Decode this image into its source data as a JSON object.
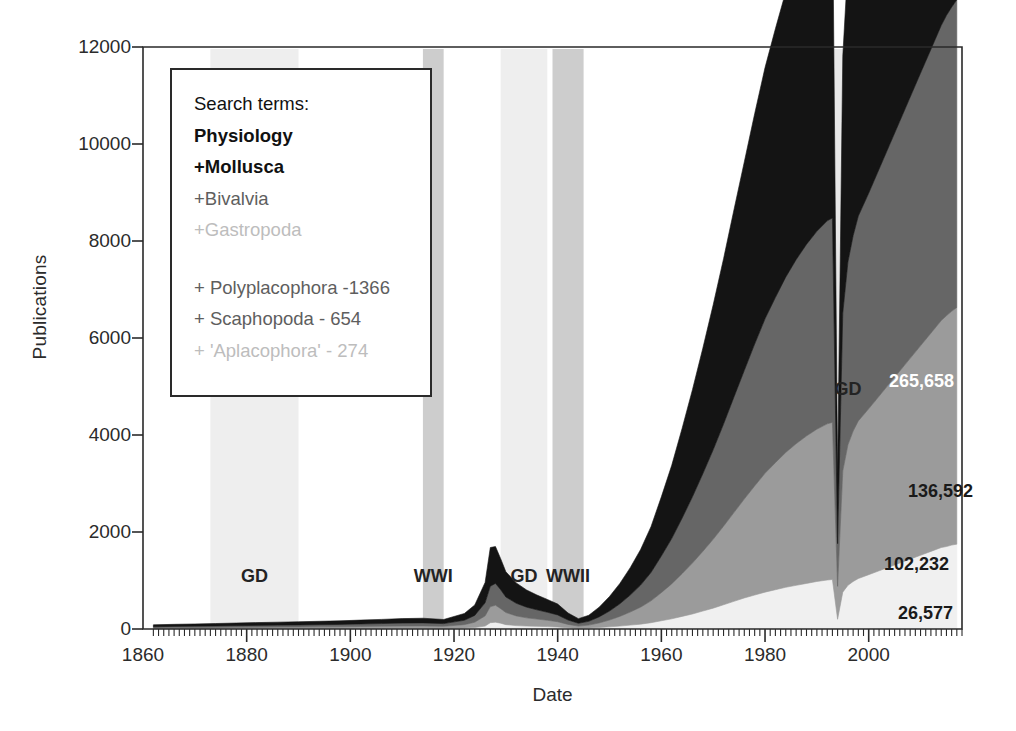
{
  "figure": {
    "background": "#ffffff",
    "plot_box": {
      "left": 143,
      "top": 47,
      "right": 962,
      "bottom": 629
    }
  },
  "legend": {
    "title": "Search terms:",
    "entries": [
      {
        "label": "Physiology",
        "color": "#111111",
        "weight": "bold"
      },
      {
        "label": "+Mollusca",
        "color": "#111111",
        "weight": "bold"
      },
      {
        "label": "+Bivalvia",
        "color": "#5e5e5e",
        "weight": "normal"
      },
      {
        "label": "+Gastropoda",
        "color": "#bdbdbd",
        "weight": "normal"
      }
    ],
    "footnotes": [
      {
        "label": "+ Polyplacophora -1366",
        "color": "#5e5e5e"
      },
      {
        "label": "+ Scaphopoda - 654",
        "color": "#5e5e5e"
      },
      {
        "label": "+ 'Aplacophora' - 274",
        "color": "#cfcfcf"
      }
    ]
  },
  "chart_data": {
    "type": "area",
    "title": "",
    "subtitle": "",
    "xlabel": "Date",
    "ylabel": "Publications",
    "xlim": [
      1860,
      2018
    ],
    "ylim": [
      0,
      12000
    ],
    "xticks": [
      1860,
      1880,
      1900,
      1920,
      1940,
      1960,
      1980,
      2000
    ],
    "yticks": [
      0,
      2000,
      4000,
      6000,
      8000,
      10000,
      12000
    ],
    "grid": false,
    "legend_position": "upper-left-inset",
    "stacked": true,
    "stack_order_bottom_to_top": [
      "Gastropoda",
      "Bivalvia",
      "Mollusca",
      "Physiology"
    ],
    "colors": {
      "Physiology": "#141414",
      "Mollusca": "#666666",
      "Bivalvia": "#9b9b9b",
      "Gastropoda": "#f0f0f0"
    },
    "totals": {
      "Physiology": "265,658",
      "Mollusca": "136,592",
      "Bivalvia": "102,232",
      "Gastropoda": "26,577"
    },
    "x": [
      1862,
      1866,
      1870,
      1874,
      1878,
      1882,
      1886,
      1890,
      1894,
      1898,
      1902,
      1906,
      1910,
      1914,
      1918,
      1922,
      1924,
      1926,
      1927,
      1928,
      1929,
      1930,
      1932,
      1934,
      1936,
      1938,
      1940,
      1942,
      1944,
      1946,
      1948,
      1950,
      1952,
      1954,
      1956,
      1958,
      1960,
      1962,
      1964,
      1966,
      1968,
      1970,
      1972,
      1974,
      1976,
      1978,
      1980,
      1982,
      1984,
      1986,
      1988,
      1990,
      1992,
      1993,
      1994,
      1995,
      1996,
      1997,
      1998,
      2000,
      2002,
      2004,
      2006,
      2008,
      2010,
      2012,
      2014,
      2015,
      2016,
      2017
    ],
    "series": [
      {
        "name": "Gastropoda",
        "color": "#f0f0f0",
        "values": [
          5,
          6,
          6,
          7,
          8,
          8,
          9,
          9,
          10,
          10,
          12,
          12,
          14,
          14,
          12,
          20,
          30,
          60,
          130,
          140,
          120,
          90,
          70,
          60,
          55,
          50,
          40,
          25,
          15,
          20,
          30,
          45,
          60,
          80,
          100,
          130,
          170,
          210,
          260,
          310,
          370,
          430,
          500,
          570,
          640,
          700,
          760,
          810,
          860,
          900,
          940,
          980,
          1010,
          1020,
          200,
          760,
          900,
          980,
          1040,
          1120,
          1200,
          1280,
          1360,
          1440,
          1520,
          1600,
          1680,
          1700,
          1730,
          1750
        ]
      },
      {
        "name": "Bivalvia",
        "color": "#9b9b9b",
        "values": [
          18,
          20,
          22,
          24,
          26,
          28,
          30,
          32,
          34,
          36,
          40,
          44,
          48,
          50,
          44,
          70,
          110,
          210,
          330,
          350,
          300,
          250,
          200,
          170,
          150,
          130,
          110,
          70,
          45,
          60,
          95,
          140,
          200,
          270,
          350,
          450,
          580,
          720,
          880,
          1050,
          1230,
          1420,
          1620,
          1830,
          2040,
          2250,
          2450,
          2620,
          2780,
          2920,
          3040,
          3140,
          3220,
          3240,
          680,
          2500,
          2900,
          3100,
          3250,
          3420,
          3600,
          3780,
          3960,
          4140,
          4320,
          4500,
          4680,
          4760,
          4820,
          4880
        ]
      },
      {
        "name": "Mollusca",
        "color": "#666666",
        "values": [
          25,
          28,
          30,
          32,
          35,
          38,
          40,
          42,
          45,
          48,
          52,
          56,
          60,
          62,
          55,
          90,
          140,
          270,
          420,
          450,
          390,
          320,
          260,
          220,
          190,
          165,
          140,
          90,
          58,
          78,
          125,
          185,
          260,
          350,
          455,
          585,
          755,
          935,
          1145,
          1365,
          1600,
          1845,
          2105,
          2380,
          2650,
          2925,
          3185,
          3405,
          3615,
          3795,
          3950,
          4080,
          4185,
          4215,
          880,
          3250,
          3770,
          4030,
          4225,
          4445,
          4680,
          4915,
          5150,
          5385,
          5620,
          5850,
          6085,
          6190,
          6270,
          6345
        ]
      },
      {
        "name": "Physiology",
        "color": "#141414",
        "values": [
          38,
          42,
          46,
          50,
          54,
          58,
          62,
          66,
          70,
          74,
          80,
          86,
          92,
          96,
          85,
          140,
          215,
          420,
          800,
          760,
          640,
          520,
          420,
          355,
          305,
          265,
          225,
          145,
          95,
          125,
          200,
          300,
          420,
          565,
          735,
          945,
          1220,
          1510,
          1850,
          2210,
          2590,
          2990,
          3410,
          3860,
          4300,
          4750,
          5180,
          5540,
          5885,
          6180,
          6435,
          6650,
          6820,
          6870,
          1430,
          5300,
          6150,
          6570,
          6890,
          7250,
          7630,
          8020,
          8400,
          8800,
          9200,
          9600,
          10150,
          10450,
          10300,
          10200
        ]
      }
    ],
    "annotations": [
      {
        "label": "GD",
        "x_start": 1873,
        "x_end": 1890,
        "shade": "#eeeeee",
        "label_y_px": 566
      },
      {
        "label": "WWI",
        "x_start": 1914,
        "x_end": 1918,
        "shade": "#cdcdcd",
        "label_y_px": 566
      },
      {
        "label": "GD",
        "x_start": 1929,
        "x_end": 1938,
        "shade": "#eeeeee",
        "label_y_px": 566
      },
      {
        "label": "WWII",
        "x_start": 1939,
        "x_end": 1945,
        "shade": "#cdcdcd",
        "label_y_px": 566
      },
      {
        "label": "GD",
        "x_start": 1993,
        "x_end": 1999,
        "shade": "#e8e8e8",
        "label_y_px": 379
      }
    ],
    "value_callouts": [
      {
        "text": "265,658",
        "x_px": 889,
        "y_px": 381,
        "on": "dark"
      },
      {
        "text": "136,592",
        "x_px": 908,
        "y_px": 491,
        "on": "light"
      },
      {
        "text": "102,232",
        "x_px": 884,
        "y_px": 564,
        "on": "light"
      },
      {
        "text": "26,577",
        "x_px": 898,
        "y_px": 613,
        "on": "light"
      }
    ]
  }
}
